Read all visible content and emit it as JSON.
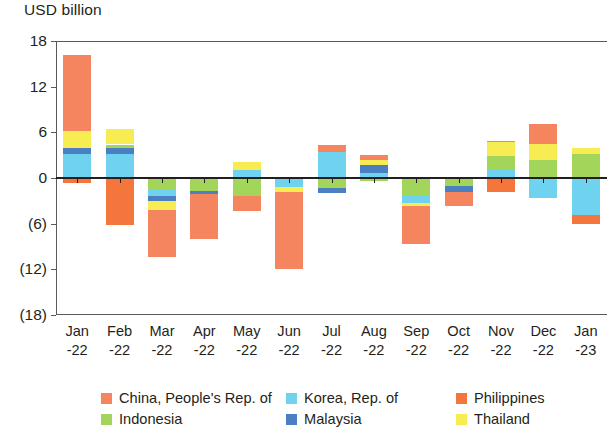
{
  "chart_data": {
    "type": "bar",
    "stacked": true,
    "title": "",
    "subtitle": "",
    "xlabel": "",
    "ylabel": "USD billion",
    "ylim": [
      -18,
      18
    ],
    "yticks": [
      18,
      12,
      6,
      0,
      -6,
      -12,
      -18
    ],
    "ytick_labels": [
      "18",
      "12",
      "6",
      "0",
      "(6)",
      "(12)",
      "(18)"
    ],
    "grid": false,
    "legend_position": "bottom",
    "categories": [
      "Jan-22",
      "Feb-22",
      "Mar-22",
      "Apr-22",
      "May-22",
      "Jun-22",
      "Jul-22",
      "Aug-22",
      "Sep-22",
      "Oct-22",
      "Nov-22",
      "Dec-22",
      "Jan-23"
    ],
    "category_lines": [
      [
        "Jan",
        "-22"
      ],
      [
        "Feb",
        "-22"
      ],
      [
        "Mar",
        "-22"
      ],
      [
        "Apr",
        "-22"
      ],
      [
        "May",
        "-22"
      ],
      [
        "Jun",
        "-22"
      ],
      [
        "Jul",
        "-22"
      ],
      [
        "Aug",
        "-22"
      ],
      [
        "Sep",
        "-22"
      ],
      [
        "Oct",
        "-22"
      ],
      [
        "Nov",
        "-22"
      ],
      [
        "Dec",
        "-22"
      ],
      [
        "Jan",
        "-23"
      ]
    ],
    "series": [
      {
        "name": "China, People's Rep. of",
        "color": "#F4855E",
        "values": [
          10.0,
          0.0,
          -6.2,
          -5.9,
          -2.1,
          -10.2,
          1.0,
          0.6,
          -5.0,
          -1.8,
          0.2,
          2.6,
          0.0
        ]
      },
      {
        "name": "Indonesia",
        "color": "#A3D55B",
        "values": [
          0.0,
          0.4,
          -1.5,
          -1.7,
          -2.3,
          -0.3,
          -1.3,
          -0.4,
          -2.2,
          -1.0,
          1.9,
          2.4,
          3.1
        ]
      },
      {
        "name": "Korea, Rep. of",
        "color": "#6FD3EF",
        "values": [
          3.2,
          3.2,
          -0.9,
          0.0,
          1.0,
          -0.9,
          3.4,
          0.6,
          -1.1,
          0.0,
          1.0,
          -2.6,
          -4.8
        ]
      },
      {
        "name": "Malaysia",
        "color": "#4A7FC1",
        "values": [
          0.7,
          0.8,
          -0.6,
          -0.4,
          0.0,
          0.0,
          -0.7,
          1.1,
          0.0,
          -0.9,
          0.0,
          0.0,
          0.0
        ]
      },
      {
        "name": "Philippines",
        "color": "#F4763C",
        "values": [
          -0.7,
          -6.2,
          0.0,
          0.0,
          0.0,
          0.0,
          0.0,
          0.0,
          0.0,
          0.0,
          -1.8,
          0.0,
          -1.3
        ]
      },
      {
        "name": "Thailand",
        "color": "#F7EC52",
        "values": [
          2.3,
          2.1,
          -1.2,
          0.0,
          1.1,
          -0.6,
          0.0,
          0.7,
          -0.4,
          0.0,
          1.8,
          2.1,
          0.9
        ]
      }
    ],
    "stack_order_positive": [
      "Philippines",
      "Korea, Rep. of",
      "Malaysia",
      "Indonesia",
      "Thailand",
      "China, People's Rep. of"
    ],
    "stack_order_negative": [
      "Indonesia",
      "Korea, Rep. of",
      "Malaysia",
      "Thailand",
      "China, People's Rep. of",
      "Philippines"
    ],
    "totals": [
      15.5,
      0.3,
      -10.4,
      -8.0,
      -2.3,
      -12.0,
      2.4,
      2.6,
      -8.7,
      -3.7,
      3.1,
      4.5,
      -2.1
    ]
  },
  "legend": {
    "items": [
      {
        "label": "China, People's Rep. of",
        "color": "#F4855E"
      },
      {
        "label": "Indonesia",
        "color": "#A3D55B"
      },
      {
        "label": "Korea, Rep. of",
        "color": "#6FD3EF"
      },
      {
        "label": "Malaysia",
        "color": "#4A7FC1"
      },
      {
        "label": "Philippines",
        "color": "#F4763C"
      },
      {
        "label": "Thailand",
        "color": "#F7EC52"
      }
    ]
  }
}
